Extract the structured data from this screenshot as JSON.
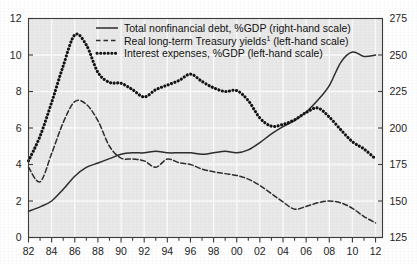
{
  "chart_data": {
    "type": "line",
    "title": "",
    "xlabel": "",
    "ylabel_left": "",
    "ylabel_right": "",
    "grid": true,
    "legend_position": "top-center",
    "x": [
      1982,
      1983,
      1984,
      1985,
      1986,
      1987,
      1988,
      1989,
      1990,
      1991,
      1992,
      1993,
      1994,
      1995,
      1996,
      1997,
      1998,
      1999,
      2000,
      2001,
      2002,
      2003,
      2004,
      2005,
      2006,
      2007,
      2008,
      2009,
      2010,
      2011,
      2012
    ],
    "xtick_labels": [
      "82",
      "84",
      "86",
      "88",
      "90",
      "92",
      "94",
      "96",
      "98",
      "00",
      "02",
      "04",
      "06",
      "08",
      "10",
      "12"
    ],
    "xtick_values": [
      1982,
      1984,
      1986,
      1988,
      1990,
      1992,
      1994,
      1996,
      1998,
      2000,
      2002,
      2004,
      2006,
      2008,
      2010,
      2012
    ],
    "xlim": [
      1982,
      2012.6
    ],
    "left_axis": {
      "ticks": [
        0,
        2,
        4,
        6,
        8,
        10,
        12
      ],
      "labels": [
        "0",
        "2",
        "4",
        "6",
        "8",
        "10",
        "12"
      ],
      "lim": [
        0,
        12
      ]
    },
    "right_axis": {
      "ticks": [
        125,
        150,
        175,
        200,
        225,
        250,
        275
      ],
      "labels": [
        "125",
        "150",
        "175",
        "200",
        "225",
        "250",
        "275"
      ],
      "lim": [
        125,
        275
      ]
    },
    "series": [
      {
        "name": "Total nonfinancial debt, %GDP (right-hand scale)",
        "key": "debt",
        "style": "solid",
        "axis": "right",
        "color": "#2b2b2b",
        "values": [
          143,
          146,
          150,
          158,
          167,
          173,
          176,
          179,
          182,
          183,
          183,
          184,
          183,
          183,
          183,
          182,
          183,
          184,
          183,
          185,
          190,
          196,
          201,
          205,
          211,
          219,
          229,
          245,
          252,
          249,
          250
        ]
      },
      {
        "name": "Real long-term Treasury yields¹ (left-hand scale)",
        "key": "real_yields",
        "style": "dashed",
        "axis": "left",
        "color": "#2b2b2b",
        "values": [
          3.85,
          3.05,
          4.6,
          6.3,
          7.45,
          7.3,
          6.4,
          5.0,
          4.35,
          4.3,
          4.2,
          3.85,
          4.3,
          4.1,
          4.0,
          3.75,
          3.6,
          3.5,
          3.4,
          3.2,
          2.85,
          2.4,
          1.95,
          1.55,
          1.7,
          1.9,
          2.0,
          1.9,
          1.6,
          1.15,
          0.8
        ]
      },
      {
        "name": "Interest expenses, %GDP (left-hand scale)",
        "key": "interest_exp",
        "style": "dotted",
        "axis": "left",
        "color": "#111111",
        "values": [
          4.2,
          5.55,
          7.4,
          9.4,
          11.1,
          10.55,
          9.05,
          8.5,
          8.45,
          8.1,
          7.7,
          8.1,
          8.35,
          8.6,
          8.95,
          8.55,
          8.2,
          8.0,
          8.05,
          7.5,
          6.55,
          6.1,
          6.2,
          6.45,
          6.85,
          7.1,
          6.6,
          5.9,
          5.25,
          4.85,
          4.3
        ]
      }
    ],
    "legend": [
      {
        "label": "Total nonfinancial debt, %GDP (right-hand scale)",
        "style": "solid"
      },
      {
        "label": "Real long-term Treasury yields¹ (left-hand scale)",
        "style": "dashed",
        "superscript": "1"
      },
      {
        "label": "Interest expenses, %GDP (left-hand scale)",
        "style": "dotted"
      }
    ],
    "colors": {
      "plot_background": "#e9e9e9",
      "gridline": "#fbfbfb",
      "axis": "#3a3a3a",
      "page_background": "#ffffff",
      "ink": "#1a1a1a"
    }
  }
}
